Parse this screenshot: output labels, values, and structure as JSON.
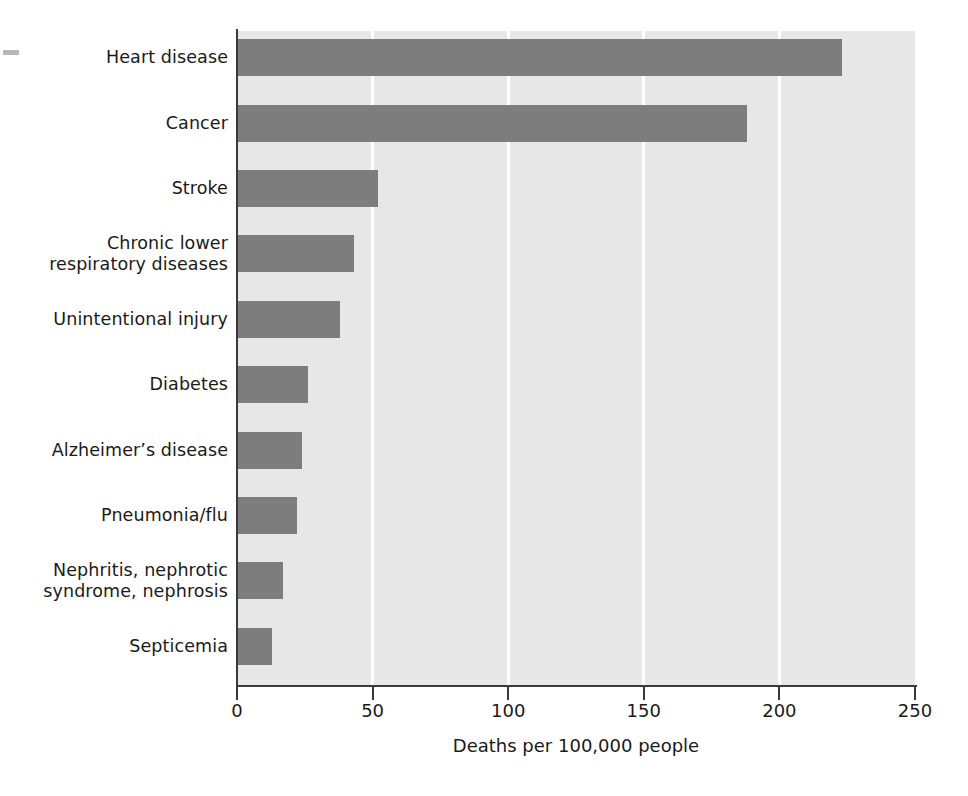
{
  "chart_data": {
    "type": "bar",
    "orientation": "horizontal",
    "title": "",
    "xlabel": "Deaths per 100,000 people",
    "ylabel": "",
    "xlim": [
      0,
      250
    ],
    "xticks": [
      0,
      50,
      100,
      150,
      200,
      250
    ],
    "xtick_labels": [
      "0",
      "50",
      "100",
      "150",
      "200",
      "250"
    ],
    "grid": "vertical-white-gridlines",
    "legend": "none",
    "categories": [
      "Heart disease",
      "Cancer",
      "Stroke",
      "Chronic lower\nrespiratory diseases",
      "Unintentional injury",
      "Diabetes",
      "Alzheimer’s disease",
      "Pneumonia/flu",
      "Nephritis, nephrotic\nsyndrome, nephrosis",
      "Septicemia"
    ],
    "values": [
      223,
      188,
      52,
      43,
      38,
      26,
      24,
      22,
      17,
      13
    ],
    "colors": {
      "bar": "#7d7d7d",
      "plot_background": "#e7e7e7",
      "gridline": "#ffffff",
      "axis": "#3a3a3a",
      "text": "#1a1a1a",
      "page_background": "#ffffff"
    }
  },
  "axis": {
    "x_title": "Deaths per 100,000 people",
    "ticks": [
      {
        "label": "0",
        "value": 0
      },
      {
        "label": "50",
        "value": 50
      },
      {
        "label": "100",
        "value": 100
      },
      {
        "label": "150",
        "value": 150
      },
      {
        "label": "200",
        "value": 200
      },
      {
        "label": "250",
        "value": 250
      }
    ]
  },
  "bars": [
    {
      "label": "Heart disease",
      "value": 223
    },
    {
      "label": "Cancer",
      "value": 188
    },
    {
      "label": "Stroke",
      "value": 52
    },
    {
      "label": "Chronic lower\nrespiratory diseases",
      "value": 43
    },
    {
      "label": "Unintentional injury",
      "value": 38
    },
    {
      "label": "Diabetes",
      "value": 26
    },
    {
      "label": "Alzheimer’s disease",
      "value": 24
    },
    {
      "label": "Pneumonia/flu",
      "value": 22
    },
    {
      "label": "Nephritis, nephrotic\nsyndrome, nephrosis",
      "value": 17
    },
    {
      "label": "Septicemia",
      "value": 13
    }
  ]
}
